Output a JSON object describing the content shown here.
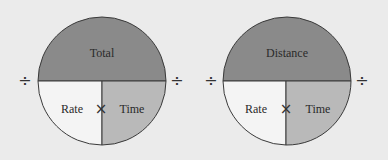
{
  "colors": {
    "background": "#ebebeb",
    "top_fill": "#8a8a8a",
    "bottom_left_fill": "#f4f4f4",
    "bottom_right_fill": "#b9b9b9",
    "stroke": "#3a3a3a"
  },
  "diagrams": [
    {
      "top_label": "Total",
      "bottom_left_label": "Rate",
      "bottom_right_label": "Time",
      "multiply_symbol": "×",
      "divide_left": "÷",
      "divide_right": "÷"
    },
    {
      "top_label": "Distance",
      "bottom_left_label": "Rate",
      "bottom_right_label": "Time",
      "multiply_symbol": "×",
      "divide_left": "÷",
      "divide_right": "÷"
    }
  ]
}
